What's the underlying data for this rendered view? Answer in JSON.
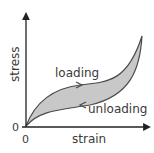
{
  "diagram": {
    "x_axis_label": "strain",
    "y_axis_label": "stress",
    "x_origin_label": "0",
    "y_origin_label": "0",
    "curve_labels": {
      "loading": "loading",
      "unloading": "unloading"
    },
    "colors": {
      "fill": "#c8c8c8",
      "stroke": "#4a4a4a",
      "axis": "#222222",
      "text": "#3a3a3a"
    }
  }
}
